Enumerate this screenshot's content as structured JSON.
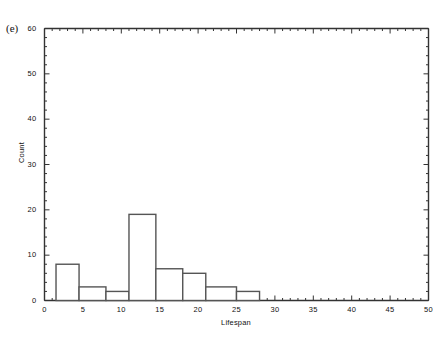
{
  "panel": {
    "label": "(e)"
  },
  "chart_data": {
    "type": "bar",
    "title": "",
    "subtitle": "",
    "xlabel": "Lifespan",
    "ylabel": "Count",
    "xlim": [
      0,
      50
    ],
    "ylim": [
      0,
      60
    ],
    "grid": false,
    "legend": null,
    "x_major_ticks": [
      0,
      5,
      10,
      15,
      20,
      25,
      30,
      35,
      40,
      45,
      50
    ],
    "x_tick_labels": [
      "0",
      "5",
      "10",
      "15",
      "20",
      "25",
      "30",
      "35",
      "40",
      "45",
      "50"
    ],
    "x_minor_tick_interval": 1,
    "y_major_ticks": [
      0,
      10,
      20,
      30,
      40,
      50,
      60
    ],
    "y_tick_labels": [
      "0",
      "10",
      "20",
      "30",
      "40",
      "50",
      "60"
    ],
    "y_minor_tick_interval": 2,
    "bin_edges": [
      1.5,
      4.5,
      8,
      11,
      14.5,
      18,
      21,
      25,
      28
    ],
    "bars": [
      {
        "x0": 1.5,
        "x1": 4.5,
        "value": 8
      },
      {
        "x0": 4.5,
        "x1": 8,
        "value": 3
      },
      {
        "x0": 8,
        "x1": 11,
        "value": 2
      },
      {
        "x0": 11,
        "x1": 14.5,
        "value": 19
      },
      {
        "x0": 14.5,
        "x1": 18,
        "value": 7
      },
      {
        "x0": 18,
        "x1": 21,
        "value": 6
      },
      {
        "x0": 21,
        "x1": 25,
        "value": 3
      },
      {
        "x0": 25,
        "x1": 28,
        "value": 2
      }
    ],
    "categories": [
      "1.5-4.5",
      "4.5-8",
      "8-11",
      "11-14.5",
      "14.5-18",
      "18-21",
      "21-25",
      "25-28"
    ],
    "values": [
      8,
      3,
      2,
      19,
      7,
      6,
      3,
      2
    ],
    "bar_fill_color": "#ffffff",
    "bar_stroke_color": "#555555",
    "axis_color": "#333333",
    "background_color": "#ffffff"
  },
  "caption": {
    "ghost_text": ""
  }
}
